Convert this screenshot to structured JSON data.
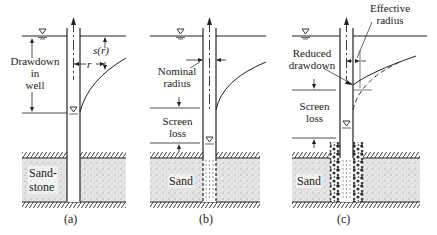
{
  "figure": {
    "panels": [
      {
        "id": "a",
        "caption": "(a)",
        "labels": {
          "drawdown": [
            "Drawdown",
            "in",
            "well"
          ],
          "s_of_r": "s(r)",
          "r": "r",
          "soil": [
            "Sand-",
            "stone"
          ]
        }
      },
      {
        "id": "b",
        "caption": "(b)",
        "labels": {
          "nominal_radius": [
            "Nominal",
            "radius"
          ],
          "screen_loss": [
            "Screen",
            "loss"
          ],
          "soil": "Sand"
        }
      },
      {
        "id": "c",
        "caption": "(c)",
        "labels": {
          "effective_radius": [
            "Effective",
            "radius"
          ],
          "reduced_drawdown": [
            "Reduced",
            "drawdown"
          ],
          "screen_loss": [
            "Screen",
            "loss"
          ],
          "soil": "Sand"
        }
      }
    ],
    "colors": {
      "line": "#222222",
      "sand_fill": "#d9d9d9",
      "background": "#ffffff"
    }
  }
}
